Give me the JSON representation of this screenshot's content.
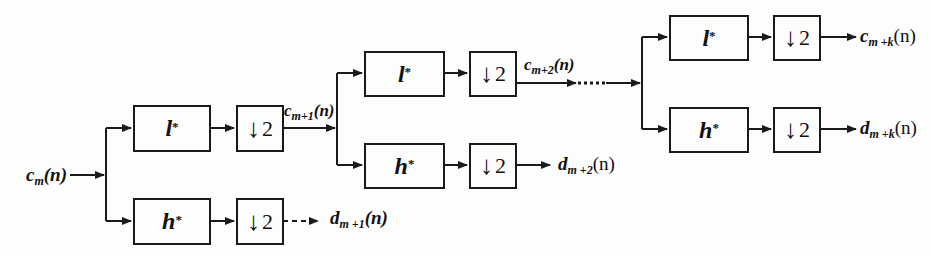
{
  "diagram": {
    "type": "wavelet-decomposition-filter-bank",
    "input": {
      "var": "c",
      "sub": "m",
      "arg": "(n)"
    },
    "stages": [
      {
        "lowpass_filter": {
          "sym": "l",
          "sup": "*"
        },
        "highpass_filter": {
          "sym": "h",
          "sup": "*"
        },
        "downsample_low": {
          "arrow": "↓",
          "factor": "2"
        },
        "downsample_high": {
          "arrow": "↓",
          "factor": "2"
        },
        "approx_out": {
          "var": "c",
          "sub": "m+1",
          "arg": "(n)"
        },
        "detail_out": {
          "var": "d",
          "sub": "m +1",
          "arg": "(n)"
        }
      },
      {
        "lowpass_filter": {
          "sym": "l",
          "sup": "*"
        },
        "highpass_filter": {
          "sym": "h",
          "sup": "*"
        },
        "downsample_low": {
          "arrow": "↓",
          "factor": "2"
        },
        "downsample_high": {
          "arrow": "↓",
          "factor": "2"
        },
        "approx_out": {
          "var": "c",
          "sub": "m+2",
          "arg": "(n)"
        },
        "detail_out": {
          "var": "d",
          "sub": "m +2",
          "arg": "(n)"
        }
      },
      {
        "lowpass_filter": {
          "sym": "l",
          "sup": "*"
        },
        "highpass_filter": {
          "sym": "h",
          "sup": "*"
        },
        "downsample_low": {
          "arrow": "↓",
          "factor": "2"
        },
        "downsample_high": {
          "arrow": "↓",
          "factor": "2"
        },
        "approx_out": {
          "var": "c",
          "sub": "m +k",
          "arg": "(n)"
        },
        "detail_out": {
          "var": "d",
          "sub": "m +k",
          "arg": "(n)"
        }
      }
    ],
    "ellipsis": "......"
  }
}
